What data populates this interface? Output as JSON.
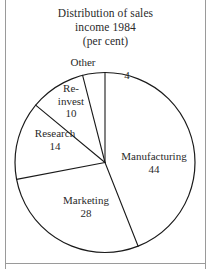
{
  "figure": {
    "title_lines": [
      "Distribution of sales",
      "income 1984",
      "(per cent)"
    ],
    "frame_color": "#9a9a9a",
    "line_color": "#1a1a1a",
    "background": "#ffffff"
  },
  "chart_data": {
    "type": "pie",
    "title": "Distribution of sales income 1984 (per cent)",
    "unit": "per cent",
    "categories": [
      "Manufacturing",
      "Marketing",
      "Research",
      "Re-invest",
      "Other"
    ],
    "values": [
      44,
      28,
      14,
      10,
      4
    ],
    "total": 100,
    "start_angle_deg": 0,
    "direction": "clockwise",
    "legend": "none",
    "labels_inline": true,
    "slices": [
      {
        "name": "Manufacturing",
        "value": 44,
        "label_name": "Manufacturing",
        "label_value": "44",
        "start_deg": 0.0,
        "end_deg": 158.4
      },
      {
        "name": "Marketing",
        "value": 28,
        "label_name": "Marketing",
        "label_value": "28",
        "start_deg": 158.4,
        "end_deg": 259.2
      },
      {
        "name": "Research",
        "value": 14,
        "label_name": "Research",
        "label_value": "14",
        "start_deg": 259.2,
        "end_deg": 309.6
      },
      {
        "name": "Re-invest",
        "value": 10,
        "label_name_line1": "Re-",
        "label_name_line2": "invest",
        "label_value": "10",
        "start_deg": 309.6,
        "end_deg": 345.6
      },
      {
        "name": "Other",
        "value": 4,
        "label_name": "Other",
        "label_value": "4",
        "start_deg": 345.6,
        "end_deg": 360.0
      }
    ]
  }
}
